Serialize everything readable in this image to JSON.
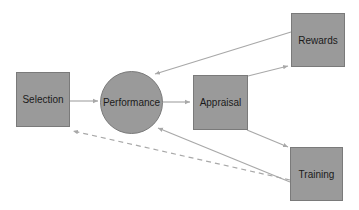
{
  "diagram": {
    "nodes": [
      {
        "id": "selection",
        "label": "Selection",
        "shape": "square"
      },
      {
        "id": "performance",
        "label": "Performance",
        "shape": "circle"
      },
      {
        "id": "appraisal",
        "label": "Appraisal",
        "shape": "square"
      },
      {
        "id": "rewards",
        "label": "Rewards",
        "shape": "square"
      },
      {
        "id": "training",
        "label": "Training",
        "shape": "square"
      }
    ],
    "edges": [
      {
        "from": "selection",
        "to": "performance",
        "style": "solid"
      },
      {
        "from": "performance",
        "to": "appraisal",
        "style": "solid"
      },
      {
        "from": "appraisal",
        "to": "rewards",
        "style": "solid"
      },
      {
        "from": "appraisal",
        "to": "training",
        "style": "solid"
      },
      {
        "from": "rewards",
        "to": "performance",
        "style": "solid"
      },
      {
        "from": "training",
        "to": "performance",
        "style": "solid"
      },
      {
        "from": "training",
        "to": "selection",
        "style": "dashed"
      }
    ],
    "colors": {
      "node_fill": "#9a9a9a",
      "node_border": "#7a7a7a",
      "arrow": "#a8a8a8",
      "text": "#1a1a1a"
    }
  }
}
